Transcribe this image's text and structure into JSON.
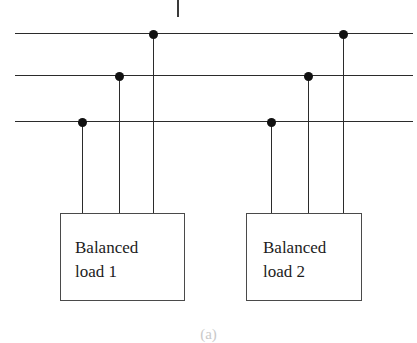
{
  "figure": {
    "caption": "(a)",
    "line_color": "#2b2b2b",
    "node_color": "#111111",
    "box_border_color": "#4a4a4a",
    "background": "#ffffff"
  },
  "bus_lines": [
    {
      "name": "phase-line-top",
      "x1": 15,
      "x2": 413,
      "y": 33
    },
    {
      "name": "phase-line-middle",
      "x1": 15,
      "x2": 413,
      "y": 75
    },
    {
      "name": "phase-line-bottom",
      "x1": 15,
      "x2": 413,
      "y": 121
    }
  ],
  "top_stub": {
    "x": 177,
    "y1": 0,
    "y2": 17
  },
  "loads": [
    {
      "id": "balanced-load-1",
      "label": "Balanced\nload 1",
      "box": {
        "x": 60,
        "y": 213,
        "width": 125,
        "height": 88
      },
      "label_x": 75,
      "label_y": 236,
      "taps": [
        {
          "name": "tap-1-phase-c",
          "x": 82,
          "dot_y": 121,
          "drop_to": 213
        },
        {
          "name": "tap-1-phase-b",
          "x": 119,
          "dot_y": 75,
          "drop_to": 213
        },
        {
          "name": "tap-1-phase-a",
          "x": 153,
          "dot_y": 33,
          "drop_to": 213
        }
      ]
    },
    {
      "id": "balanced-load-2",
      "label": "Balanced\nload 2",
      "box": {
        "x": 246,
        "y": 213,
        "width": 116,
        "height": 88
      },
      "label_x": 263,
      "label_y": 236,
      "taps": [
        {
          "name": "tap-2-phase-c",
          "x": 271,
          "dot_y": 121,
          "drop_to": 213
        },
        {
          "name": "tap-2-phase-b",
          "x": 308,
          "dot_y": 75,
          "drop_to": 213
        },
        {
          "name": "tap-2-phase-a",
          "x": 343,
          "dot_y": 33,
          "drop_to": 213
        }
      ]
    }
  ],
  "caption_position": {
    "y": 326
  }
}
